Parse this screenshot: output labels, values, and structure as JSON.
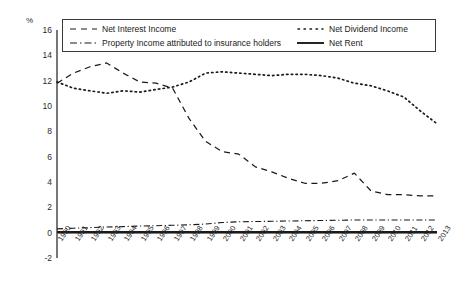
{
  "chart_data": {
    "type": "line",
    "title": "",
    "xlabel": "",
    "ylabel": "%",
    "unit_label": "%",
    "grid": false,
    "legend_position": "top-inside",
    "xlim": [
      1990,
      2013
    ],
    "ylim": [
      -2,
      16
    ],
    "ytick_values": [
      16,
      14,
      12,
      10,
      8,
      6,
      4,
      2,
      0,
      -2
    ],
    "ytick_labels": [
      "16",
      "14",
      "12",
      "10",
      "8",
      "6",
      "4",
      "2",
      "0",
      "-2"
    ],
    "categories": [
      "1990",
      "1991",
      "1992",
      "1993",
      "1994",
      "1995",
      "1996",
      "1997",
      "1998",
      "1999",
      "2000",
      "2001",
      "2002",
      "2003",
      "2004",
      "2005",
      "2006",
      "2007",
      "2008",
      "2009",
      "2010",
      "2011",
      "2012",
      "2013"
    ],
    "series": [
      {
        "name": "Net Interest Income",
        "style": "dashed",
        "color": "#1a1a1a",
        "values": [
          11.8,
          12.6,
          13.1,
          13.4,
          12.6,
          11.9,
          11.8,
          11.4,
          9.0,
          7.2,
          6.4,
          6.2,
          5.2,
          4.8,
          4.3,
          3.9,
          3.9,
          4.1,
          4.7,
          3.3,
          3.0,
          3.0,
          2.9,
          2.9
        ]
      },
      {
        "name": "Net Dividend Income",
        "style": "dotted",
        "color": "#1a1a1a",
        "values": [
          11.9,
          11.4,
          11.2,
          11.0,
          11.2,
          11.1,
          11.3,
          11.5,
          11.9,
          12.6,
          12.7,
          12.6,
          12.5,
          12.4,
          12.5,
          12.5,
          12.4,
          12.2,
          11.8,
          11.6,
          11.2,
          10.7,
          9.6,
          8.6
        ]
      },
      {
        "name": "Property Income attributed to insurance holders",
        "style": "dash-dot",
        "color": "#1a1a1a",
        "values": [
          0.3,
          0.35,
          0.4,
          0.45,
          0.48,
          0.52,
          0.55,
          0.58,
          0.62,
          0.68,
          0.8,
          0.86,
          0.88,
          0.9,
          0.92,
          0.94,
          0.96,
          0.98,
          1.0,
          1.0,
          1.0,
          1.0,
          1.0,
          1.0
        ]
      },
      {
        "name": "Net Rent",
        "style": "solid",
        "color": "#1a1a1a",
        "values": [
          0.05,
          0.05,
          0.05,
          0.05,
          0.05,
          0.05,
          0.05,
          0.05,
          0.05,
          0.05,
          0.05,
          0.05,
          0.05,
          0.05,
          0.05,
          0.05,
          0.05,
          0.05,
          0.05,
          0.05,
          0.05,
          0.05,
          0.05,
          0.05
        ]
      }
    ]
  },
  "legend": {
    "items": [
      {
        "label": "Net Interest Income",
        "style": "dashed"
      },
      {
        "label": "Property Income attributed to insurance holders",
        "style": "dash-dot"
      },
      {
        "label": "Net Dividend Income",
        "style": "dotted"
      },
      {
        "label": "Net Rent",
        "style": "solid"
      }
    ]
  }
}
